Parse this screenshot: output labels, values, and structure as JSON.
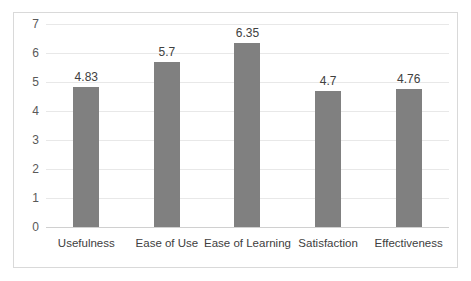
{
  "chart_data": {
    "type": "bar",
    "title": "",
    "subtitle": "",
    "xlabel": "",
    "ylabel": "",
    "categories": [
      "Usefulness",
      "Ease of Use",
      "Ease of Learning",
      "Satisfaction",
      "Effectiveness"
    ],
    "values": [
      4.83,
      5.7,
      6.35,
      4.7,
      4.76
    ],
    "data_labels": [
      "4.83",
      "5.7",
      "6.35",
      "4.7",
      "4.76"
    ],
    "ylim": [
      0,
      7
    ],
    "ytick_step": 1,
    "ytick_labels": [
      "7",
      "6",
      "5",
      "4",
      "3",
      "2",
      "1",
      "0"
    ],
    "ytick_values": [
      7,
      6,
      5,
      4,
      3,
      2,
      1,
      0
    ],
    "grid": true,
    "grid_axis": "y",
    "legend": false,
    "legend_position": "none",
    "annotations": []
  },
  "style": {
    "bar_color": "#808080",
    "grid_color": "#e8e8e8",
    "axis_color": "#d0d0d0",
    "border_color": "#d9d9d9",
    "background": "#ffffff",
    "label_color": "#404040",
    "tick_color": "#595959"
  }
}
